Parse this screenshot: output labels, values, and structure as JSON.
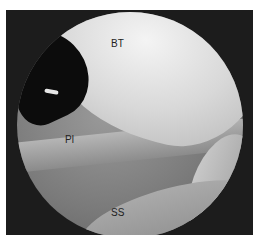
{
  "image": {
    "description": "Arthroscopic view of shoulder joint with labeled structures",
    "labels": [
      {
        "id": "bt",
        "text": "BT"
      },
      {
        "id": "pl",
        "text": "Pl"
      },
      {
        "id": "ss",
        "text": "SS"
      }
    ]
  }
}
